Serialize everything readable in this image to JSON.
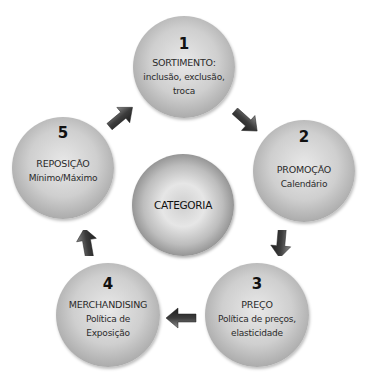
{
  "diagram": {
    "center": {
      "label": "CATEGORIA"
    },
    "steps": [
      {
        "number": "1",
        "title": "SORTIMENTO:",
        "desc_lines": [
          "inclusão, exclusão,",
          "troca"
        ]
      },
      {
        "number": "2",
        "title": "PROMOÇÃO",
        "desc_lines": [
          "Calendário"
        ]
      },
      {
        "number": "3",
        "title": "PREÇO",
        "desc_lines": [
          "Política de preços,",
          "elasticidade"
        ]
      },
      {
        "number": "4",
        "title": "MERCHANDISING",
        "desc_lines": [
          "Política de",
          "Exposição"
        ]
      },
      {
        "number": "5",
        "title": "REPOSIÇÃO",
        "desc_lines": [
          "Mínimo/Máximo"
        ]
      }
    ],
    "arrows": [
      {
        "from": "5",
        "to": "1",
        "icon": "arrow-up-right-icon"
      },
      {
        "from": "1",
        "to": "2",
        "icon": "arrow-down-right-icon"
      },
      {
        "from": "2",
        "to": "3",
        "icon": "arrow-down-icon"
      },
      {
        "from": "3",
        "to": "4",
        "icon": "arrow-left-icon"
      },
      {
        "from": "4",
        "to": "5",
        "icon": "arrow-up-icon"
      }
    ],
    "colors": {
      "background": "#ffffff",
      "circle_light": "#e8e8e8",
      "circle_dark": "#8a8a8a",
      "arrow": "#3a3a3a",
      "text": "#2a2a2a"
    }
  }
}
